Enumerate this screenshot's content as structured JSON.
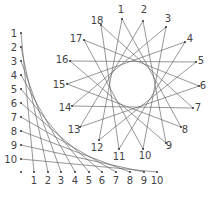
{
  "figure": {
    "colors": {
      "line": "#6a6a6a",
      "dot": "#333333",
      "label": "#444444",
      "background": "#ffffff"
    },
    "corner_curve": {
      "left_axis": {
        "x": 21,
        "points": [
          {
            "label": "1",
            "y": 33
          },
          {
            "label": "2",
            "y": 47
          },
          {
            "label": "3",
            "y": 61
          },
          {
            "label": "4",
            "y": 75
          },
          {
            "label": "5",
            "y": 89
          },
          {
            "label": "6",
            "y": 103
          },
          {
            "label": "7",
            "y": 117
          },
          {
            "label": "8",
            "y": 131
          },
          {
            "label": "9",
            "y": 145
          },
          {
            "label": "10",
            "y": 159
          }
        ]
      },
      "bottom_axis": {
        "y": 172,
        "points": [
          {
            "label": "1",
            "x": 34
          },
          {
            "label": "2",
            "x": 48
          },
          {
            "label": "3",
            "x": 61
          },
          {
            "label": "4",
            "x": 75
          },
          {
            "label": "5",
            "x": 89
          },
          {
            "label": "6",
            "x": 102
          },
          {
            "label": "7",
            "x": 116
          },
          {
            "label": "8",
            "x": 130
          },
          {
            "label": "9",
            "x": 144
          },
          {
            "label": "10",
            "x": 157
          }
        ]
      },
      "corner_dot": {
        "x": 21,
        "y": 172
      }
    },
    "star": {
      "skip": 7,
      "points": [
        {
          "label": "1",
          "x": 122,
          "y": 19,
          "lx": 121,
          "ly": 13
        },
        {
          "label": "2",
          "x": 143,
          "y": 21,
          "lx": 144,
          "ly": 13
        },
        {
          "label": "3",
          "x": 166,
          "y": 27,
          "lx": 168,
          "ly": 22
        },
        {
          "label": "4",
          "x": 185,
          "y": 42,
          "lx": 190,
          "ly": 42
        },
        {
          "label": "5",
          "x": 196,
          "y": 62,
          "lx": 201,
          "ly": 64
        },
        {
          "label": "6",
          "x": 199,
          "y": 86,
          "lx": 203,
          "ly": 89
        },
        {
          "label": "7",
          "x": 193,
          "y": 108,
          "lx": 198,
          "ly": 111
        },
        {
          "label": "8",
          "x": 181,
          "y": 127,
          "lx": 185,
          "ly": 133
        },
        {
          "label": "9",
          "x": 166,
          "y": 143,
          "lx": 169,
          "ly": 149
        },
        {
          "label": "10",
          "x": 143,
          "y": 149,
          "lx": 145,
          "ly": 159
        },
        {
          "label": "11",
          "x": 119,
          "y": 149,
          "lx": 119,
          "ly": 160
        },
        {
          "label": "12",
          "x": 99,
          "y": 140,
          "lx": 97,
          "ly": 151
        },
        {
          "label": "13",
          "x": 80,
          "y": 127,
          "lx": 74,
          "ly": 133
        },
        {
          "label": "14",
          "x": 72,
          "y": 106,
          "lx": 65,
          "ly": 111
        },
        {
          "label": "15",
          "x": 67,
          "y": 84,
          "lx": 59,
          "ly": 88
        },
        {
          "label": "16",
          "x": 70,
          "y": 61,
          "lx": 62,
          "ly": 63
        },
        {
          "label": "17",
          "x": 84,
          "y": 40,
          "lx": 76,
          "ly": 42
        },
        {
          "label": "18",
          "x": 101,
          "y": 25,
          "lx": 97,
          "ly": 24
        }
      ]
    }
  }
}
